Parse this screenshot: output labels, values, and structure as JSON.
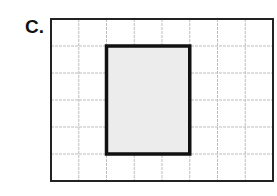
{
  "label": "C.",
  "grid": {
    "columns": 8,
    "rows": 6,
    "x": 51,
    "y": 19,
    "width": 222,
    "height": 162,
    "grid_color": "#bdbdbd",
    "border_color": "#222222"
  },
  "rectangle": {
    "col_start": 2,
    "col_end": 5,
    "row_start": 1,
    "row_end": 5,
    "width_units": 3,
    "height_units": 4,
    "fill": "#ececec",
    "stroke": "#111111"
  }
}
